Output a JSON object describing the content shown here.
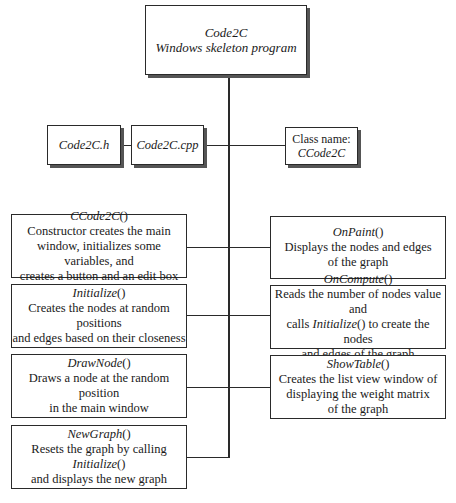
{
  "root": {
    "title": "Code2C",
    "subtitle": "Windows skeleton program"
  },
  "files": [
    {
      "name": "Code2C.h"
    },
    {
      "name": "Code2C.cpp"
    }
  ],
  "class_box": {
    "label": "Class name:",
    "name": "CCode2C"
  },
  "functions_left": [
    {
      "name": "CCode2C",
      "parens": "()",
      "lines": [
        "Constructor creates the main",
        "window, initializes some variables, and",
        "creates a button and an edit box"
      ]
    },
    {
      "name": "Initialize",
      "parens": "()",
      "lines": [
        "Creates the nodes at random positions",
        "and edges based on their closeness"
      ]
    },
    {
      "name": "DrawNode",
      "parens": "()",
      "lines": [
        "Draws a node at the random position",
        "in the main window"
      ]
    },
    {
      "name": "NewGraph",
      "parens": "()",
      "line1_pre": "Resets the graph by calling ",
      "line1_it": "Initialize",
      "line1_post": "()",
      "lines": [
        "and displays the new graph"
      ]
    }
  ],
  "functions_right": [
    {
      "name": "OnPaint",
      "parens": "()",
      "lines": [
        "Displays the nodes and edges",
        "of the graph"
      ]
    },
    {
      "name": "OnCompute",
      "parens": "()",
      "line1": "Reads the number of nodes value and",
      "line2_pre": "calls ",
      "line2_it": "Initialize",
      "line2_post": "() to create the nodes",
      "lines": [
        "and edges of the graph"
      ]
    },
    {
      "name": "ShowTable",
      "parens": "()",
      "lines": [
        "Creates the list view window of",
        "displaying the weight matrix",
        "of the graph"
      ]
    }
  ]
}
